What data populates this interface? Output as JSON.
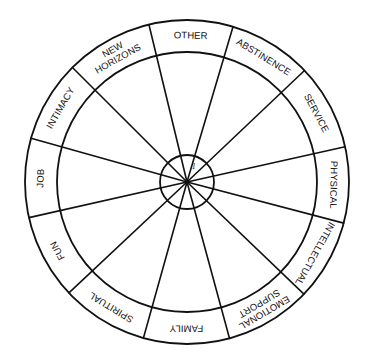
{
  "diagram": {
    "type": "wheel",
    "center": [
      187,
      182
    ],
    "outer_radius": 162,
    "inner_radius": 130,
    "hub_radius": 27,
    "line_color": "#111111",
    "background": "#ffffff",
    "hub_label": "1",
    "spoke_angles_deg": [
      -103.6,
      -73.5,
      -43.5,
      -12.6,
      14.7,
      43.8,
      74.8,
      105.6,
      136.8,
      167.3,
      195.7,
      225.0
    ],
    "segments": [
      {
        "label": "OTHER",
        "lines": [
          "OTHER"
        ],
        "start": -103.6,
        "end": -73.5
      },
      {
        "label": "ABSTINENCE",
        "lines": [
          "ABSTINENCE"
        ],
        "start": -73.5,
        "end": -43.5
      },
      {
        "label": "SERVICE",
        "lines": [
          "SERVICE"
        ],
        "start": -43.5,
        "end": -12.6
      },
      {
        "label": "PHYSICAL",
        "lines": [
          "PHYSICAL"
        ],
        "start": -12.6,
        "end": 14.7
      },
      {
        "label": "INTELLECTUAL",
        "lines": [
          "INTELLECTUAL"
        ],
        "start": 14.7,
        "end": 43.8
      },
      {
        "label": "EMOTIONAL SUPPORT",
        "lines": [
          "EMOTIONAL",
          "SUPPORT"
        ],
        "start": 43.8,
        "end": 74.8
      },
      {
        "label": "FAMILY",
        "lines": [
          "FAMILY"
        ],
        "start": 74.8,
        "end": 105.6
      },
      {
        "label": "SPIRITUAL",
        "lines": [
          "SPIRITUAL"
        ],
        "start": 105.6,
        "end": 136.8
      },
      {
        "label": "FUN",
        "lines": [
          "FUN"
        ],
        "start": 136.8,
        "end": 167.3
      },
      {
        "label": "JOB",
        "lines": [
          "JOB"
        ],
        "start": 167.3,
        "end": 195.7
      },
      {
        "label": "INTIMACY",
        "lines": [
          "INTIMACY"
        ],
        "start": 195.7,
        "end": 225.0
      },
      {
        "label": "NEW HORIZONS",
        "lines": [
          "NEW",
          "HORIZONS"
        ],
        "start": 225.0,
        "end": 256.4
      }
    ]
  }
}
